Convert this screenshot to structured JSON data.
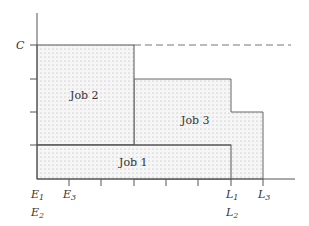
{
  "diagram": {
    "y_axis_label": "C",
    "jobs": [
      {
        "name": "Job 1",
        "label": "Job 1"
      },
      {
        "name": "Job 2",
        "label": "Job 2"
      },
      {
        "name": "Job 3",
        "label": "Job 3"
      }
    ],
    "x_labels": {
      "E1": {
        "base": "E",
        "sub": "1"
      },
      "E2": {
        "base": "E",
        "sub": "2"
      },
      "E3": {
        "base": "E",
        "sub": "3"
      },
      "L1": {
        "base": "L",
        "sub": "1"
      },
      "L2": {
        "base": "L",
        "sub": "2"
      },
      "L3": {
        "base": "L",
        "sub": "3"
      }
    },
    "colors": {
      "line": "#555555",
      "fill": "#f4f4f4",
      "dot": "#b8b8b8",
      "dash": "#777777"
    }
  }
}
